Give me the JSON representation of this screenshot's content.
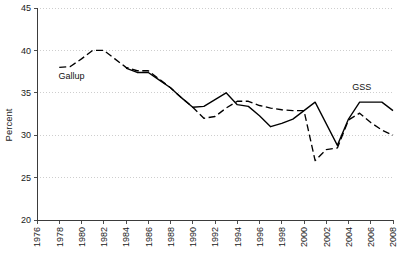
{
  "chart_data": {
    "type": "line",
    "title": "",
    "xlabel": "",
    "ylabel": "Percent",
    "xlim": [
      1976,
      2008
    ],
    "ylim": [
      20,
      45
    ],
    "ytick_step": 5,
    "xtick_step": 2,
    "grid": true,
    "legend_position": "inline-annotations",
    "yticks": [
      20,
      25,
      30,
      35,
      40,
      45
    ],
    "xticks": [
      1976,
      1978,
      1980,
      1982,
      1984,
      1986,
      1988,
      1990,
      1992,
      1994,
      1996,
      1998,
      2000,
      2002,
      2004,
      2006,
      2008
    ],
    "series": [
      {
        "name": "Gallup",
        "style": "dashed",
        "color": "#000000",
        "label_x": 1979.1,
        "label_y": 36.6,
        "points": [
          {
            "x": 1978,
            "y": 38.0
          },
          {
            "x": 1979,
            "y": 38.1
          },
          {
            "x": 1980,
            "y": 39.0
          },
          {
            "x": 1981,
            "y": 40.0
          },
          {
            "x": 1982,
            "y": 40.0
          },
          {
            "x": 1983,
            "y": 39.0
          },
          {
            "x": 1984,
            "y": 38.0
          },
          {
            "x": 1985,
            "y": 37.6
          },
          {
            "x": 1986,
            "y": 37.6
          },
          {
            "x": 1987,
            "y": 36.6
          },
          {
            "x": 1988,
            "y": 35.6
          },
          {
            "x": 1989,
            "y": 34.4
          },
          {
            "x": 1990,
            "y": 33.3
          },
          {
            "x": 1991,
            "y": 32.0
          },
          {
            "x": 1992,
            "y": 32.2
          },
          {
            "x": 1993,
            "y": 33.2
          },
          {
            "x": 1994,
            "y": 34.0
          },
          {
            "x": 1995,
            "y": 34.0
          },
          {
            "x": 1996,
            "y": 33.5
          },
          {
            "x": 1997,
            "y": 33.2
          },
          {
            "x": 1998,
            "y": 33.0
          },
          {
            "x": 1999,
            "y": 32.9
          },
          {
            "x": 2000,
            "y": 32.9
          },
          {
            "x": 2001,
            "y": 27.0
          },
          {
            "x": 2002,
            "y": 28.3
          },
          {
            "x": 2003,
            "y": 28.5
          },
          {
            "x": 2004,
            "y": 31.8
          },
          {
            "x": 2005,
            "y": 32.6
          },
          {
            "x": 2006,
            "y": 31.5
          },
          {
            "x": 2007,
            "y": 30.6
          },
          {
            "x": 2008,
            "y": 30.0
          }
        ]
      },
      {
        "name": "GSS",
        "style": "solid",
        "color": "#000000",
        "label_x": 2005.2,
        "label_y": 35.3,
        "points": [
          {
            "x": 1984,
            "y": 37.9
          },
          {
            "x": 1985,
            "y": 37.4
          },
          {
            "x": 1986,
            "y": 37.4
          },
          {
            "x": 1987,
            "y": 36.5
          },
          {
            "x": 1988,
            "y": 35.6
          },
          {
            "x": 1989,
            "y": 34.4
          },
          {
            "x": 1990,
            "y": 33.3
          },
          {
            "x": 1991,
            "y": 33.4
          },
          {
            "x": 1993,
            "y": 35.0
          },
          {
            "x": 1994,
            "y": 33.6
          },
          {
            "x": 1995,
            "y": 33.4
          },
          {
            "x": 1996,
            "y": 32.3
          },
          {
            "x": 1997,
            "y": 31.0
          },
          {
            "x": 1998,
            "y": 31.4
          },
          {
            "x": 1999,
            "y": 31.9
          },
          {
            "x": 2000,
            "y": 32.9
          },
          {
            "x": 2001,
            "y": 33.9
          },
          {
            "x": 2003,
            "y": 28.8
          },
          {
            "x": 2004,
            "y": 31.9
          },
          {
            "x": 2005,
            "y": 33.9
          },
          {
            "x": 2006,
            "y": 33.9
          },
          {
            "x": 2007,
            "y": 33.9
          },
          {
            "x": 2008,
            "y": 32.9
          }
        ]
      }
    ]
  }
}
